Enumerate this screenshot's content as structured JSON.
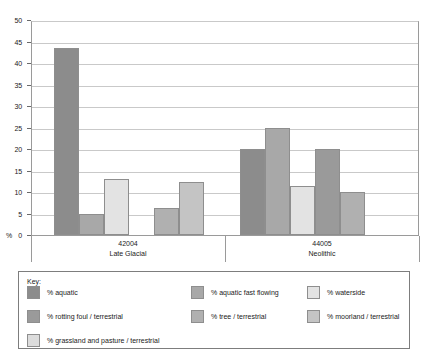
{
  "chart_data": {
    "type": "bar",
    "title": "",
    "xlabel": "",
    "ylabel": "%",
    "ylim": [
      0,
      50
    ],
    "ytick_step": 5,
    "yticks": [
      0,
      5,
      10,
      15,
      20,
      25,
      30,
      35,
      40,
      45,
      50
    ],
    "grid": true,
    "legend_position": "bottom",
    "legend_title": "Key:",
    "categories": [
      "42004",
      "44005"
    ],
    "category_sublabels": [
      "Late Glacial",
      "Neolithic"
    ],
    "series": [
      {
        "name": "% aquatic",
        "color": "#8c8c8c",
        "values": [
          43.5,
          20.0
        ]
      },
      {
        "name": "% aquatic fast flowing",
        "color": "#a8a8a8",
        "values": [
          5.0,
          25.0
        ]
      },
      {
        "name": "% waterside",
        "color": "#e3e3e3",
        "values": [
          13.0,
          11.5
        ]
      },
      {
        "name": "%  rotting foul / terrestrial",
        "color": "#9a9a9a",
        "values": [
          0,
          20.0
        ]
      },
      {
        "name": "% tree / terrestrial",
        "color": "#b0b0b0",
        "values": [
          6.3,
          10.0
        ]
      },
      {
        "name": "% moorland / terrestrial",
        "color": "#c4c4c4",
        "values": [
          12.4,
          0
        ]
      },
      {
        "name": "% grassland and pasture / terrestrial",
        "color": "#dcdcdc",
        "values": [
          0,
          0
        ]
      }
    ]
  },
  "legend": {
    "title": "Key:",
    "entries": [
      {
        "label": "% aquatic",
        "color": "#8c8c8c"
      },
      {
        "label": "% aquatic fast flowing",
        "color": "#a8a8a8"
      },
      {
        "label": "% waterside",
        "color": "#e3e3e3"
      },
      {
        "label": "%  rotting foul / terrestrial",
        "color": "#9a9a9a"
      },
      {
        "label": "% tree / terrestrial",
        "color": "#b0b0b0"
      },
      {
        "label": "% moorland / terrestrial",
        "color": "#c4c4c4"
      },
      {
        "label": "% grassland and pasture / terrestrial",
        "color": "#dcdcdc"
      }
    ]
  }
}
